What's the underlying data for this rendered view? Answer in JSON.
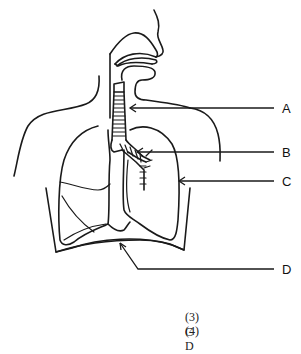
{
  "diagram": {
    "labels": [
      {
        "id": "A",
        "text": "A",
        "points_to": "trachea"
      },
      {
        "id": "B",
        "text": "B",
        "points_to": "bronchus"
      },
      {
        "id": "C",
        "text": "C",
        "points_to": "lung"
      },
      {
        "id": "D",
        "text": "D",
        "points_to": "diaphragm"
      }
    ]
  },
  "options": [
    {
      "number": "(3)",
      "text": "C"
    },
    {
      "number": "(4)",
      "text": "D"
    }
  ],
  "colors": {
    "ink": "#1a1a1a",
    "background": "#ffffff"
  }
}
